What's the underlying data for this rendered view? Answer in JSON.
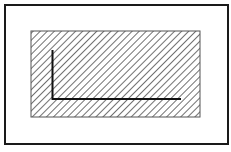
{
  "diagram": {
    "outer_frame": {
      "x": 4,
      "y": 4,
      "width": 225,
      "height": 141,
      "stroke": "#1a1a1a"
    },
    "hatched_region": {
      "x": 31,
      "y": 31,
      "width": 169,
      "height": 86,
      "hatch_spacing": 5,
      "hatch_color": "#333333",
      "hatch_direction": "diagonal-up-right"
    },
    "l_shape": {
      "vertical": {
        "x": 52,
        "y1": 50,
        "y2": 99
      },
      "horizontal": {
        "y": 99,
        "x1": 52,
        "x2": 181
      },
      "stroke": "#111111",
      "stroke_width": 2
    }
  }
}
